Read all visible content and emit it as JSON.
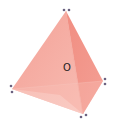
{
  "diagram": {
    "type": "tetrahedron",
    "center_label": "O",
    "colors": {
      "face_main": "#f2958a",
      "face_light": "#f8c2b8",
      "face_dark": "#ee8276",
      "face_bottom": "#fad3cc",
      "edge": "#f4a79d",
      "vertex_dot": "#6b6280",
      "label": "#222222"
    },
    "vertices": [
      {
        "name": "apex",
        "x": 66,
        "y": 11
      },
      {
        "name": "left",
        "x": 12,
        "y": 89
      },
      {
        "name": "right",
        "x": 103,
        "y": 81
      },
      {
        "name": "bottom",
        "x": 83,
        "y": 114
      }
    ],
    "vertex_markers": [
      {
        "vertex": "apex",
        "dots": [
          [
            64,
            10
          ],
          [
            69,
            10
          ]
        ]
      },
      {
        "vertex": "left",
        "dots": [
          [
            11,
            86
          ],
          [
            12,
            92
          ]
        ]
      },
      {
        "vertex": "right",
        "dots": [
          [
            105,
            79
          ],
          [
            105,
            84
          ]
        ]
      },
      {
        "vertex": "bottom",
        "dots": [
          [
            81,
            117
          ],
          [
            86,
            115
          ]
        ]
      }
    ],
    "center": {
      "x": 67,
      "y": 68
    }
  }
}
